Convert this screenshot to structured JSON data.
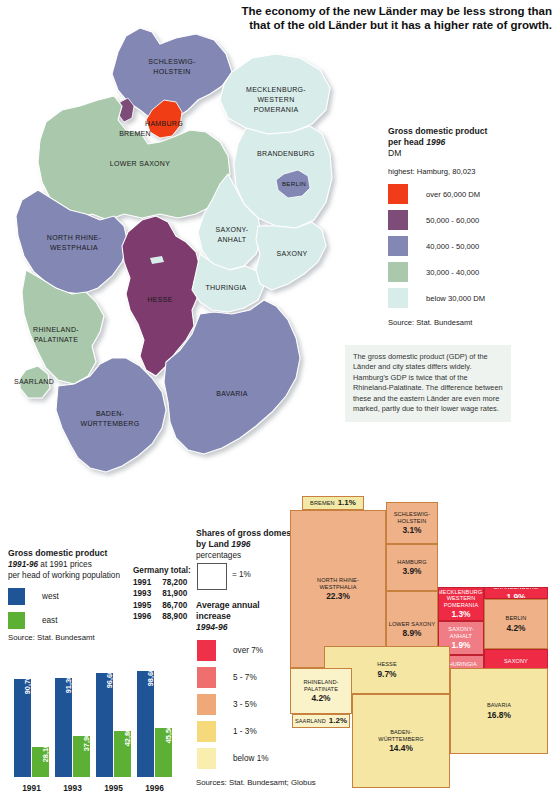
{
  "title": "The economy of the new Länder may be less strong than that of the old Länder but it has a higher rate of growth.",
  "map": {
    "labels": [
      {
        "name": "SCHLESWIG-HOLSTEIN",
        "lines": [
          "SCHLESWIG-",
          "HOLSTEIN"
        ]
      },
      {
        "name": "HAMBURG",
        "lines": [
          "HAMBURG"
        ]
      },
      {
        "name": "BREMEN",
        "lines": [
          "BREMEN"
        ]
      },
      {
        "name": "MECKLENBURG-WESTERN POMERANIA",
        "lines": [
          "MECKLENBURG-",
          "WESTERN",
          "POMERANIA"
        ]
      },
      {
        "name": "LOWER SAXONY",
        "lines": [
          "LOWER SAXONY"
        ]
      },
      {
        "name": "BRANDENBURG",
        "lines": [
          "BRANDENBURG"
        ]
      },
      {
        "name": "BERLIN",
        "lines": [
          "BERLIN"
        ]
      },
      {
        "name": "SAXONY-ANHALT",
        "lines": [
          "SAXONY-",
          "ANHALT"
        ]
      },
      {
        "name": "NORTH RHINE-WESTPHALIA",
        "lines": [
          "NORTH RHINE-",
          "WESTPHALIA"
        ]
      },
      {
        "name": "SAXONY",
        "lines": [
          "SAXONY"
        ]
      },
      {
        "name": "THURINGIA",
        "lines": [
          "THURINGIA"
        ]
      },
      {
        "name": "HESSE",
        "lines": [
          "HESSE"
        ]
      },
      {
        "name": "RHINELAND-PALATINATE",
        "lines": [
          "RHINELAND-",
          "PALATINATE"
        ]
      },
      {
        "name": "SAARLAND",
        "lines": [
          "SAARLAND"
        ]
      },
      {
        "name": "BAVARIA",
        "lines": [
          "BAVARIA"
        ]
      },
      {
        "name": "BADEN-WÜRTTEMBERG",
        "lines": [
          "BADEN-",
          "WÜRTTEMBERG"
        ]
      }
    ]
  },
  "gdp_legend": {
    "heading_line1": "Gross domestic product",
    "heading_line2_pre": "per head ",
    "heading_year": "1996",
    "unit": "DM",
    "highest": "highest: Hamburg, 80,023",
    "items": [
      {
        "label": "over 60,000 DM",
        "color": "#f03c18"
      },
      {
        "label": "50,000 - 60,000",
        "color": "#7d4c78"
      },
      {
        "label": "40,000 - 50,000",
        "color": "#8287b4"
      },
      {
        "label": "30,000 - 40,000",
        "color": "#a9c8ac"
      },
      {
        "label": "below  30,000 DM",
        "color": "#d8ecea"
      }
    ],
    "source": "Source: Stat. Bundesamt"
  },
  "note": "The gross domestic product (GDP) of the Länder and city states differs widely. Hamburg's GDP is twice that of the Rhineland-Palatinate. The difference between these and the eastern Länder are even more marked, partly due to their lower wage rates.",
  "bar_block": {
    "heading": "Gross domestic product",
    "period": "1991-96",
    "sub_rest": " at 1991 prices",
    "sub2": "per head of working population",
    "keys": [
      {
        "label": "west",
        "color": "#1f5596"
      },
      {
        "label": "east",
        "color": "#5cb034"
      }
    ],
    "source": "Source: Stat. Bundesamt",
    "totals_heading": "Germany total:",
    "totals": [
      {
        "year": "1991",
        "value": "78,200"
      },
      {
        "year": "1993",
        "value": "81,900"
      },
      {
        "year": "1995",
        "value": "86,700"
      },
      {
        "year": "1996",
        "value": "88,900"
      }
    ]
  },
  "chart_data": {
    "type": "bar",
    "title": "Gross domestic product 1991-96 at 1991 prices per head of working population",
    "categories": [
      "1991",
      "1993",
      "1995",
      "1996"
    ],
    "series": [
      {
        "name": "west",
        "color": "#1f5596",
        "values": [
          90700,
          91300,
          96600,
          98600
        ],
        "labels": [
          "90,700",
          "91,300",
          "96,600",
          "98,600"
        ]
      },
      {
        "name": "east",
        "color": "#5cb034",
        "values": [
          28100,
          37900,
          42800,
          45500
        ],
        "labels": [
          "28,100",
          "37,900",
          "42,800",
          "45,500"
        ]
      }
    ],
    "ylim": [
      0,
      100000
    ],
    "ylabel": "DM per head of working population",
    "xlabel": "",
    "grid": false,
    "legend_position": "upper-left"
  },
  "shares_legend": {
    "heading_line1": "Shares of gross domestic product",
    "heading_line2_pre": "by Land ",
    "heading_year": "1996",
    "unit": "percentages",
    "box_note": "= 1%",
    "avg_line1": "Average annual",
    "avg_line2": "increase",
    "avg_year": "1994-96",
    "bands": [
      {
        "label": "over 7%",
        "color": "#ee3048"
      },
      {
        "label": "5 - 7%",
        "color": "#ef6e6e"
      },
      {
        "label": "3 - 5%",
        "color": "#efa877"
      },
      {
        "label": "1 - 3%",
        "color": "#f5d97a"
      },
      {
        "label": "below 1%",
        "color": "#faeeae"
      }
    ],
    "sources": "Sources: Stat. Bundesamt; Globus"
  },
  "treemap": {
    "type": "treemap",
    "cells": [
      {
        "name": "BREMEN",
        "pct": "1.1%",
        "value": 1.1,
        "band": "1 - 3%",
        "color": "#f2e9a8",
        "inline": true
      },
      {
        "name": "NORTH RHINE-WESTPHALIA",
        "lines": [
          "NORTH RHINE-",
          "WESTPHALIA"
        ],
        "pct": "22.3%",
        "value": 22.3,
        "band": "3 - 5%",
        "color": "#efb187"
      },
      {
        "name": "SCHLESWIG-HOLSTEIN",
        "lines": [
          "SCHLESWIG-",
          "HOLSTEIN"
        ],
        "pct": "3.1%",
        "value": 3.1,
        "band": "3 - 5%",
        "color": "#efb187"
      },
      {
        "name": "HAMBURG",
        "lines": [
          "HAMBURG"
        ],
        "pct": "3.9%",
        "value": 3.9,
        "band": "3 - 5%",
        "color": "#efb187"
      },
      {
        "name": "LOWER SAXONY",
        "lines": [
          "LOWER SAXONY"
        ],
        "pct": "8.9%",
        "value": 8.9,
        "band": "3 - 5%",
        "color": "#efb187"
      },
      {
        "name": "MECKLENBURG-WESTERN POMERANIA",
        "lines": [
          "MECKLENBURG-",
          "WESTERN",
          "POMERANIA"
        ],
        "pct": "1.3%",
        "value": 1.3,
        "band": "over 7%",
        "color": "#ee2a45"
      },
      {
        "name": "BRANDENBURG",
        "lines": [
          "BRANDENBURG"
        ],
        "pct": "1.9%",
        "value": 1.9,
        "band": "over 7%",
        "color": "#ee2a45"
      },
      {
        "name": "BERLIN",
        "lines": [
          "BERLIN"
        ],
        "pct": "4.2%",
        "value": 4.2,
        "band": "3 - 5%",
        "color": "#efb187"
      },
      {
        "name": "SAXONY-ANHALT",
        "lines": [
          "SAXONY-",
          "ANHALT"
        ],
        "pct": "1.9%",
        "value": 1.9,
        "band": "5 - 7%",
        "color": "#f07d85"
      },
      {
        "name": "THURINGIA",
        "lines": [
          "THURINGIA"
        ],
        "pct": "1.7%",
        "value": 1.7,
        "band": "5 - 7%",
        "color": "#f07d85"
      },
      {
        "name": "SAXONY",
        "lines": [
          "SAXONY"
        ],
        "pct": "3.3%",
        "value": 3.3,
        "band": "over 7%",
        "color": "#ee2a45"
      },
      {
        "name": "HESSE",
        "lines": [
          "HESSE"
        ],
        "pct": "9.7%",
        "value": 9.7,
        "band": "1 - 3%",
        "color": "#f5e6a4"
      },
      {
        "name": "RHINELAND-PALATINATE",
        "lines": [
          "RHINELAND-",
          "PALATINATE"
        ],
        "pct": "4.2%",
        "value": 4.2,
        "band": "below 1%",
        "color": "#faf2c9"
      },
      {
        "name": "SAARLAND",
        "pct": "1.2%",
        "value": 1.2,
        "band": "below 1%",
        "color": "#faf2c9",
        "inline": true
      },
      {
        "name": "BADEN-WÜRTTEMBERG",
        "lines": [
          "BADEN-",
          "WÜRTTEMBERG"
        ],
        "pct": "14.4%",
        "value": 14.4,
        "band": "1 - 3%",
        "color": "#f5e6a4"
      },
      {
        "name": "BAVARIA",
        "lines": [
          "BAVARIA"
        ],
        "pct": "16.8%",
        "value": 16.8,
        "band": "1 - 3%",
        "color": "#f5e6a4"
      }
    ]
  }
}
